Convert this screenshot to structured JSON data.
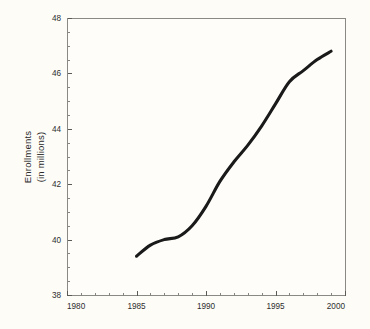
{
  "chart_data": {
    "type": "line",
    "title": "",
    "xlabel": "",
    "ylabel": "Enrollments\n(in millions)",
    "ylabel_line1": "Enrollments",
    "ylabel_line2": "(in millions)",
    "xlim": [
      1980,
      2000
    ],
    "ylim": [
      38,
      48
    ],
    "x_ticks": [
      1980,
      1985,
      1990,
      1995,
      2000
    ],
    "x_tick_labels": [
      "1980",
      "1985",
      "1990",
      "1995",
      "2000"
    ],
    "x_minor_step": 1,
    "y_ticks": [
      38,
      40,
      42,
      44,
      46,
      48
    ],
    "y_tick_labels": [
      "38",
      "40",
      "42",
      "44",
      "46",
      "48"
    ],
    "y_minor_step": 0.5,
    "grid": false,
    "legend": null,
    "legend_position": "none",
    "line_color": "#1a1a1a",
    "background_color": "#fdfcf7",
    "frame_color": "#8a8a85",
    "series": [
      {
        "name": "Enrollments",
        "x": [
          1985,
          1986,
          1987,
          1988,
          1989,
          1990,
          1991,
          1992,
          1993,
          1994,
          1995,
          1996,
          1997,
          1998,
          1999
        ],
        "values": [
          39.4,
          39.8,
          40.0,
          40.1,
          40.5,
          41.2,
          42.1,
          42.8,
          43.4,
          44.1,
          44.9,
          45.7,
          46.1,
          46.5,
          46.8
        ]
      }
    ]
  },
  "figure": {
    "x_axis_name": "Year",
    "y_axis_name": "Enrollments (in millions)"
  }
}
